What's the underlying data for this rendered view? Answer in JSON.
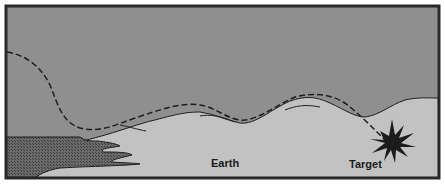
{
  "diagram": {
    "type": "terrain-following trajectory illustration",
    "labels": {
      "earth": "Earth",
      "target": "Target"
    },
    "colors": {
      "sky": "#8f8f8f",
      "ground": "#c2c2c2",
      "water": "#5a5a5a",
      "frame": "#2a2a2a",
      "path": "#1e1e1e",
      "target_burst": "#1c1c1c"
    }
  }
}
